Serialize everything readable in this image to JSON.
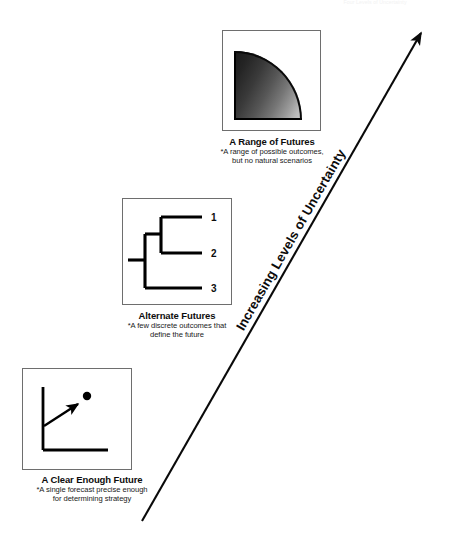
{
  "figure": {
    "axis_label": "Increasing Levels of Uncertainty",
    "top_note": "Four Levels of Uncertainty"
  },
  "panels": [
    {
      "id": "range-of-futures",
      "title": "A Range of Futures",
      "subtitle_line1": "*A range of possible outcomes,",
      "subtitle_line2": "but no natural scenarios",
      "graphic": "gradient-quarter-disc"
    },
    {
      "id": "alternate-futures",
      "title": "Alternate Futures",
      "subtitle_line1": "*A few discrete outcomes that",
      "subtitle_line2": "define the future",
      "graphic": "branching-tree",
      "branch_labels": [
        "1",
        "2",
        "3"
      ]
    },
    {
      "id": "clear-enough-future",
      "title": "A Clear Enough Future",
      "subtitle_line1": "*A single forecast precise enough",
      "subtitle_line2": "for determining strategy",
      "graphic": "single-point-forecast"
    }
  ],
  "colors": {
    "line": "#000000",
    "frame": "#6e6e6e",
    "text": "#111111",
    "gradient_dark": "#1b1b1b",
    "gradient_light": "#c9c9c9"
  }
}
